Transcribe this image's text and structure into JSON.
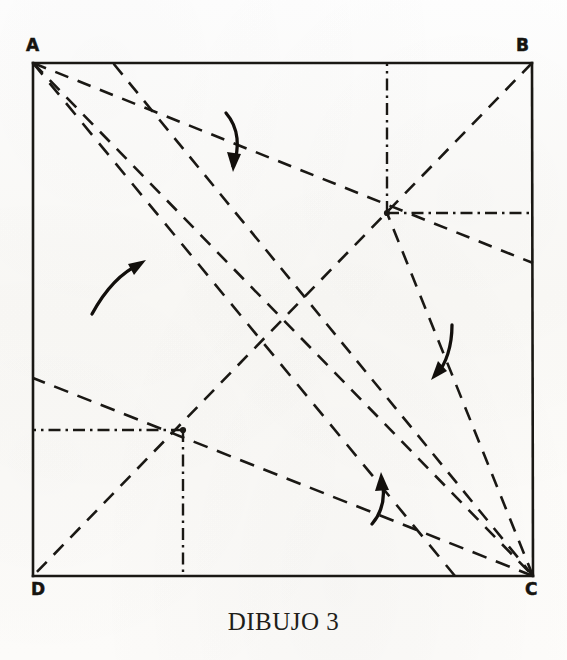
{
  "figure": {
    "caption": "DIBUJO 3",
    "title_text": "DIBUJO 3",
    "vertices": [
      {
        "name": "A",
        "label": "A",
        "x": 33,
        "y": 63,
        "label_x": 26,
        "label_y": 37
      },
      {
        "name": "B",
        "label": "B",
        "x": 532,
        "y": 63,
        "label_x": 516,
        "label_y": 37
      },
      {
        "name": "C",
        "label": "C",
        "x": 533,
        "y": 576,
        "label_x": 522,
        "label_y": 581
      },
      {
        "name": "D",
        "label": "D",
        "x": 33,
        "y": 576,
        "label_x": 30,
        "label_y": 581
      }
    ],
    "nodes": [
      {
        "name": "upper-node",
        "x": 387,
        "y": 213
      },
      {
        "name": "lower-node",
        "x": 183,
        "y": 430
      }
    ],
    "solid_edges": [
      {
        "name": "edge-AB",
        "from": "A",
        "to": "B"
      },
      {
        "name": "edge-BC",
        "from": "B",
        "to": "C"
      },
      {
        "name": "edge-CD",
        "from": "C",
        "to": "D"
      },
      {
        "name": "edge-DA",
        "from": "D",
        "to": "A"
      }
    ],
    "dashed_lines": [
      {
        "name": "fold-A-to-upper-node-ext",
        "x1": 33,
        "y1": 63,
        "x2": 533,
        "y2": 263
      },
      {
        "name": "fold-A-to-C-diagonal",
        "x1": 33,
        "y1": 63,
        "x2": 533,
        "y2": 576
      },
      {
        "name": "fold-A-to-lower-right",
        "x1": 33,
        "y1": 63,
        "x2": 455,
        "y2": 576
      },
      {
        "name": "fold-C-to-B-diagonal",
        "x1": 533,
        "y1": 576,
        "x2": 532,
        "y2": 63
      },
      {
        "name": "fold-B-to-D-diagonal",
        "x1": 532,
        "y1": 63,
        "x2": 33,
        "y2": 576
      },
      {
        "name": "fold-C-to-lower-node-ext",
        "x1": 533,
        "y1": 576,
        "x2": 33,
        "y2": 378
      },
      {
        "name": "fold-C-to-upper-left",
        "x1": 533,
        "y1": 576,
        "x2": 113,
        "y2": 63
      }
    ],
    "dash_dot_lines": [
      {
        "name": "perp-upper-node-up",
        "x1": 387,
        "y1": 213,
        "x2": 387,
        "y2": 63
      },
      {
        "name": "perp-upper-node-right",
        "x1": 387,
        "y1": 213,
        "x2": 533,
        "y2": 213
      },
      {
        "name": "perp-lower-node-left",
        "x1": 183,
        "y1": 430,
        "x2": 33,
        "y2": 430
      },
      {
        "name": "perp-lower-node-down",
        "x1": 183,
        "y1": 430,
        "x2": 183,
        "y2": 576
      }
    ],
    "arrows": [
      {
        "name": "fold-arrow-top",
        "direction": "down",
        "tip_x": 233,
        "tip_y": 165
      },
      {
        "name": "fold-arrow-left",
        "direction": "up-right",
        "tip_x": 141,
        "tip_y": 262
      },
      {
        "name": "fold-arrow-right",
        "direction": "down-left",
        "tip_x": 434,
        "tip_y": 374
      },
      {
        "name": "fold-arrow-bottom",
        "direction": "up",
        "tip_x": 381,
        "tip_y": 477
      }
    ]
  },
  "style": {
    "ink_color": "#1a1814",
    "paper_color": "#fdfcfa",
    "line_width": "2",
    "dash_pattern": "13 9",
    "dash_dot_pattern": "11 5 2 5"
  }
}
